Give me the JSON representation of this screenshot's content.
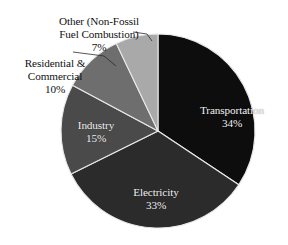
{
  "chart_data": {
    "type": "pie",
    "title": "",
    "subtitle": "",
    "legend_position": "none",
    "grid": false,
    "units": "percent",
    "start_angle_deg": 0,
    "direction": "clockwise",
    "categories": [
      "Transportation",
      "Electricity",
      "Industry",
      "Residential & Commercial",
      "Other (Non-Fossil Fuel Combustion)"
    ],
    "values": [
      34,
      33,
      15,
      10,
      7
    ],
    "slices": [
      {
        "name": "Transportation",
        "label": "Transportation",
        "value": 34,
        "value_label": "34%",
        "color": "#0d0d0d",
        "label_placement": "inside",
        "label_color": "#f2f2f2"
      },
      {
        "name": "Electricity",
        "label": "Electricity",
        "value": 33,
        "value_label": "33%",
        "color": "#2b2b2b",
        "label_placement": "inside",
        "label_color": "#f2f2f2"
      },
      {
        "name": "Industry",
        "label": "Industry",
        "value": 15,
        "value_label": "15%",
        "color": "#4a4a4a",
        "label_placement": "inside",
        "label_color": "#f2f2f2"
      },
      {
        "name": "Residential & Commercial",
        "label": "Residential &\nCommercial",
        "value": 10,
        "value_label": "10%",
        "color": "#6e6e6e",
        "label_placement": "outside",
        "label_color": "#111111"
      },
      {
        "name": "Other (Non-Fossil Fuel Combustion)",
        "label": "Other (Non-Fossil\nFuel Combustion)",
        "value": 7,
        "value_label": "7%",
        "color": "#a9a9a9",
        "label_placement": "outside",
        "label_color": "#111111"
      }
    ],
    "background_color": "#ffffff",
    "separator_color": "#e8e8e8",
    "leader_line_color": "#2a2a2a"
  }
}
